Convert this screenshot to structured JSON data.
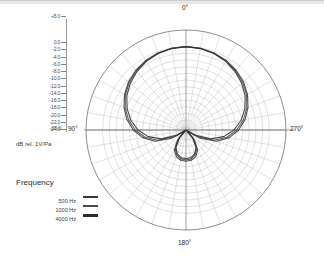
{
  "axis": {
    "caption": "dB rel. 1V/Pa",
    "bottom_value": "-25.0",
    "ticks": [
      "+5.0",
      "0.0",
      "-2.0",
      "-4.0",
      "-6.0",
      "-8.0",
      "-10.0",
      "-12.0",
      "-14.0",
      "-16.0",
      "-18.0",
      "-20.0",
      "-22.0",
      "-24.0"
    ]
  },
  "angles": {
    "top": "0°",
    "right": "270°",
    "left": "90°",
    "bottom": "180°"
  },
  "legend": {
    "title": "Frequency",
    "items": [
      {
        "label": "500 Hz",
        "color": "#383838",
        "thickness": 2
      },
      {
        "label": "1000 Hz",
        "color": "#4a4a4a",
        "thickness": 1.5
      },
      {
        "label": "4000 Hz",
        "color": "#2b2b2b",
        "thickness": 2.5
      }
    ]
  },
  "chart_data": {
    "type": "line",
    "coordinate_system": "polar",
    "title": "",
    "xlabel": "Angle (degrees)",
    "ylabel": "dB rel. 1V/Pa",
    "grid": true,
    "legend_position": "left",
    "rlim": [
      -25.0,
      5.0
    ],
    "r_ticks": [
      5.0,
      0.0,
      -2.0,
      -4.0,
      -6.0,
      -8.0,
      -10.0,
      -12.0,
      -14.0,
      -16.0,
      -18.0,
      -20.0,
      -22.0,
      -24.0
    ],
    "angle_ticks": [
      0,
      90,
      180,
      270
    ],
    "angle_tick_labels": [
      "0°",
      "90°",
      "180°",
      "270°"
    ],
    "angle_step_deg": 10,
    "angles": [
      0,
      10,
      20,
      30,
      40,
      50,
      60,
      70,
      80,
      90,
      100,
      110,
      120,
      130,
      140,
      150,
      160,
      170,
      180,
      190,
      200,
      210,
      220,
      230,
      240,
      250,
      260,
      270,
      280,
      290,
      300,
      310,
      320,
      330,
      340,
      350,
      360
    ],
    "series": [
      {
        "name": "500 Hz",
        "color": "#383838",
        "values": [
          0.0,
          -0.1,
          -0.4,
          -0.9,
          -1.6,
          -2.5,
          -3.7,
          -5.2,
          -7.0,
          -9.2,
          -11.8,
          -15.2,
          -20.0,
          -24.5,
          -21.0,
          -18.0,
          -16.5,
          -15.8,
          -15.6,
          -15.8,
          -16.5,
          -18.0,
          -21.0,
          -24.5,
          -20.0,
          -15.2,
          -11.8,
          -9.2,
          -7.0,
          -5.2,
          -3.7,
          -2.5,
          -1.6,
          -0.9,
          -0.4,
          -0.1,
          0.0
        ]
      },
      {
        "name": "1000 Hz",
        "color": "#4a4a4a",
        "values": [
          0.0,
          -0.1,
          -0.5,
          -1.0,
          -1.8,
          -2.8,
          -4.0,
          -5.6,
          -7.5,
          -9.8,
          -12.5,
          -16.0,
          -21.0,
          -24.8,
          -21.5,
          -18.5,
          -17.0,
          -16.2,
          -16.0,
          -16.2,
          -17.0,
          -18.5,
          -21.5,
          -24.8,
          -21.0,
          -16.0,
          -12.5,
          -9.8,
          -7.5,
          -5.6,
          -4.0,
          -2.8,
          -1.8,
          -1.0,
          -0.5,
          -0.1,
          0.0
        ]
      },
      {
        "name": "4000 Hz",
        "color": "#2b2b2b",
        "values": [
          0.0,
          -0.2,
          -0.6,
          -1.2,
          -2.1,
          -3.2,
          -4.5,
          -6.2,
          -8.2,
          -10.6,
          -13.5,
          -17.2,
          -22.0,
          -25.0,
          -22.0,
          -19.0,
          -17.4,
          -16.6,
          -16.4,
          -16.6,
          -17.4,
          -19.0,
          -22.0,
          -25.0,
          -22.0,
          -17.2,
          -13.5,
          -10.6,
          -8.2,
          -6.2,
          -4.5,
          -3.2,
          -2.1,
          -1.2,
          -0.6,
          -0.2,
          0.0
        ]
      }
    ]
  }
}
